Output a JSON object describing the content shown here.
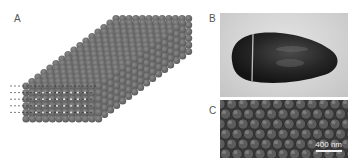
{
  "figure": {
    "panels": [
      {
        "label": "A",
        "content": "schematic of close-packed sphere array (parallelepiped) with dashed guide lines"
      },
      {
        "label": "B",
        "content": "photograph of dark ovoid object with a band"
      },
      {
        "label": "C",
        "content": "micrograph of hexagonally packed spheres"
      }
    ],
    "scale_bar": {
      "text": "400 nm"
    }
  }
}
